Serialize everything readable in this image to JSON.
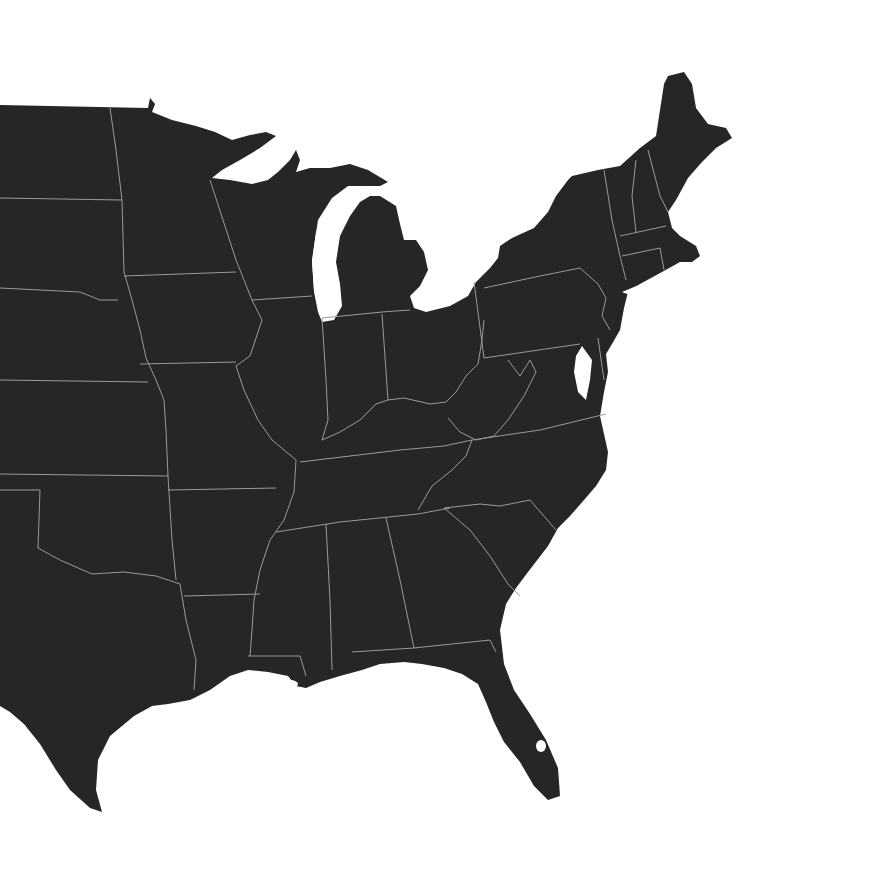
{
  "map": {
    "region": "Eastern United States",
    "colors": {
      "land": "#262626",
      "border": "#9a9a9a",
      "water": "#ffffff"
    },
    "states": [
      {
        "id": "north-dakota"
      },
      {
        "id": "south-dakota"
      },
      {
        "id": "nebraska"
      },
      {
        "id": "kansas"
      },
      {
        "id": "oklahoma"
      },
      {
        "id": "texas"
      },
      {
        "id": "minnesota"
      },
      {
        "id": "iowa"
      },
      {
        "id": "missouri"
      },
      {
        "id": "arkansas"
      },
      {
        "id": "louisiana"
      },
      {
        "id": "wisconsin"
      },
      {
        "id": "illinois"
      },
      {
        "id": "michigan"
      },
      {
        "id": "indiana"
      },
      {
        "id": "ohio"
      },
      {
        "id": "kentucky"
      },
      {
        "id": "tennessee"
      },
      {
        "id": "mississippi"
      },
      {
        "id": "alabama"
      },
      {
        "id": "georgia"
      },
      {
        "id": "florida"
      },
      {
        "id": "south-carolina"
      },
      {
        "id": "north-carolina"
      },
      {
        "id": "virginia"
      },
      {
        "id": "west-virginia"
      },
      {
        "id": "maryland"
      },
      {
        "id": "delaware"
      },
      {
        "id": "pennsylvania"
      },
      {
        "id": "new-jersey"
      },
      {
        "id": "new-york"
      },
      {
        "id": "connecticut"
      },
      {
        "id": "rhode-island"
      },
      {
        "id": "massachusetts"
      },
      {
        "id": "vermont"
      },
      {
        "id": "new-hampshire"
      },
      {
        "id": "maine"
      }
    ]
  }
}
